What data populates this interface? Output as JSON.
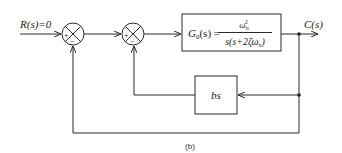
{
  "diagram": {
    "input": {
      "label": "R(s)=0"
    },
    "output": {
      "label": "C(s)"
    },
    "summing_junctions": [
      {
        "id": "sum1",
        "plus": "+",
        "minus": "−"
      },
      {
        "id": "sum2",
        "plus": "+",
        "minus": "−"
      }
    ],
    "forward_block": {
      "lhs": "G",
      "lhs_sub": "0",
      "lhs_arg": "(s) =",
      "numerator": "ω",
      "numerator_sub": "n",
      "numerator_sup": "2",
      "denominator": "s(s+2ζω",
      "denominator_sub": "n",
      "denominator_end": ")"
    },
    "feedback_block": {
      "label": "bs"
    },
    "caption": "(b)"
  }
}
